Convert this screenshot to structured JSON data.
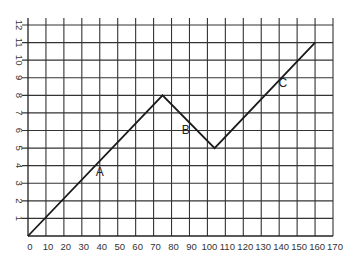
{
  "chart_data": {
    "type": "line",
    "title": "",
    "xlabel": "",
    "ylabel": "",
    "xlim": [
      0,
      170
    ],
    "ylim": [
      0,
      12
    ],
    "grid": true,
    "legend": null,
    "x_ticks": [
      0,
      10,
      20,
      30,
      40,
      50,
      60,
      70,
      80,
      90,
      100,
      110,
      120,
      130,
      140,
      150,
      160,
      170
    ],
    "y_ticks": [
      1,
      2,
      3,
      4,
      5,
      6,
      7,
      8,
      9,
      10,
      11,
      12
    ],
    "series": [
      {
        "name": "path",
        "x": [
          0,
          75,
          104,
          160
        ],
        "y": [
          0,
          8,
          5,
          11
        ]
      }
    ],
    "annotations": [
      {
        "text": "A",
        "x": 40,
        "y": 3.4
      },
      {
        "text": "B",
        "x": 88,
        "y": 5.8
      },
      {
        "text": "C",
        "x": 142,
        "y": 8.5
      }
    ]
  }
}
